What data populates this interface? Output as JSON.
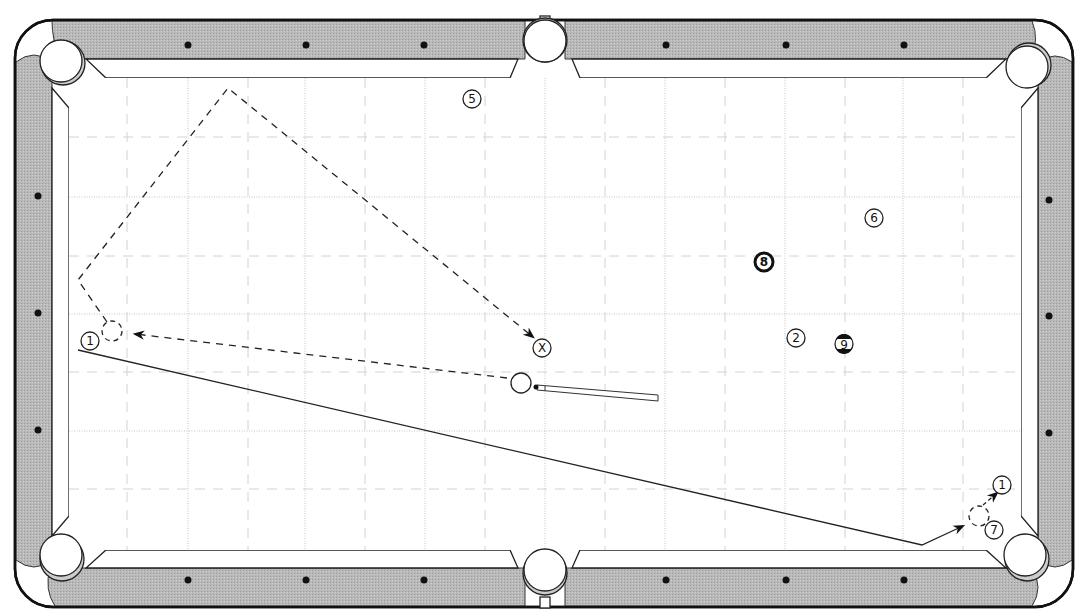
{
  "diagram": {
    "type": "pool-table-shot",
    "colors": {
      "rail": "#b4b4b4",
      "outline": "#222222",
      "grid": "#bdbdbd",
      "path": "#333333",
      "cloth": "#ffffff"
    },
    "balls": [
      {
        "id": "ball-1",
        "label": "1",
        "x": 90,
        "y": 341
      },
      {
        "id": "ball-5",
        "label": "5",
        "x": 472,
        "y": 99
      },
      {
        "id": "ball-6",
        "label": "6",
        "x": 874,
        "y": 218
      },
      {
        "id": "ball-8",
        "label": "8",
        "x": 764,
        "y": 262,
        "bold": true
      },
      {
        "id": "ball-2",
        "label": "2",
        "x": 796,
        "y": 338
      },
      {
        "id": "ball-9",
        "label": "9",
        "x": 844,
        "y": 344,
        "striped": true
      },
      {
        "id": "ball-x",
        "label": "X",
        "x": 542,
        "y": 348
      },
      {
        "id": "ball-1-target",
        "label": "1",
        "x": 1002,
        "y": 485
      },
      {
        "id": "ball-7",
        "label": "7",
        "x": 994,
        "y": 530
      }
    ],
    "cue_ball": {
      "x": 521,
      "y": 383
    },
    "ghost_balls": [
      {
        "id": "ghost-left",
        "x": 112,
        "y": 331
      },
      {
        "id": "ghost-right",
        "x": 979,
        "y": 516
      }
    ],
    "paths": {
      "cue_to_ghost": "object ball line from cue ball to left ghost ball",
      "kick_path": "cue ball rebound via top-left rails to X",
      "object_ball_path": "1 ball travels to bottom-right pocket area"
    }
  }
}
